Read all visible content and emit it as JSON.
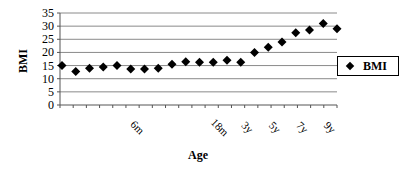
{
  "chart_data": {
    "type": "scatter",
    "title": "",
    "xlabel": "Age",
    "ylabel": "BMI",
    "ylim": [
      0,
      35
    ],
    "yticks": [
      0,
      5,
      10,
      15,
      20,
      25,
      30,
      35
    ],
    "grid": true,
    "legend": {
      "position": "right",
      "entries": [
        "BMI"
      ]
    },
    "x_tick_labels": [
      {
        "label": "6m",
        "index": 5
      },
      {
        "label": "18m",
        "index": 11
      },
      {
        "label": "3y",
        "index": 13
      },
      {
        "label": "5y",
        "index": 15
      },
      {
        "label": "7y",
        "index": 17
      },
      {
        "label": "9y",
        "index": 19
      }
    ],
    "series": [
      {
        "name": "BMI",
        "marker": "diamond",
        "color": "#000000",
        "values": [
          15,
          12.7,
          14,
          14.5,
          15,
          13.7,
          13.7,
          14,
          15.5,
          16.5,
          16.3,
          16.3,
          17,
          16.3,
          20,
          22,
          24,
          27.5,
          28.5,
          31,
          29
        ]
      }
    ]
  },
  "labels": {
    "ylabel": "BMI",
    "xlabel": "Age",
    "legend_entry": "BMI"
  }
}
